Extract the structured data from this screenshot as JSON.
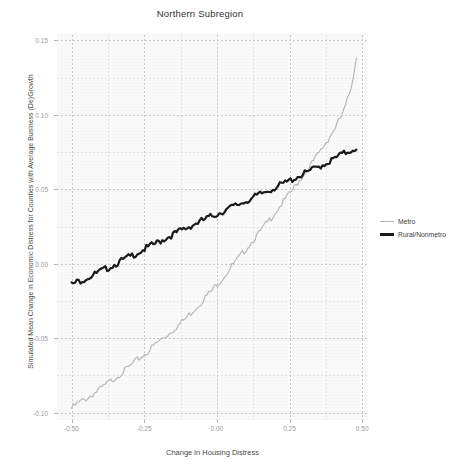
{
  "chart_data": {
    "type": "line",
    "title": "Northern Subregion",
    "xlabel": "Change in Housing Distress",
    "ylabel": "Simulated Mean Change in Economic Distress for Counties with Average Business (De)Growth",
    "xlim": [
      -0.55,
      0.52
    ],
    "ylim": [
      -0.105,
      0.155
    ],
    "xticks": [
      -0.5,
      -0.25,
      0.0,
      0.25,
      0.5
    ],
    "xtick_labels": [
      "-0.50",
      "-0.25",
      "0.00",
      "0.25",
      "0.50"
    ],
    "yticks": [
      0.15,
      0.1,
      0.05,
      0.0,
      -0.05,
      -0.1
    ],
    "ytick_labels": [
      "0.15",
      "0.10",
      "0.05",
      "0.00",
      "-0.05",
      "-0.10"
    ],
    "grid": true,
    "grid_style": "dashed",
    "legend_position": "right",
    "series": [
      {
        "name": "Metro",
        "color": "#b8b8b8",
        "width": 1.2,
        "x": [
          -0.5,
          -0.48,
          -0.46,
          -0.44,
          -0.42,
          -0.4,
          -0.38,
          -0.36,
          -0.34,
          -0.32,
          -0.3,
          -0.28,
          -0.26,
          -0.24,
          -0.22,
          -0.2,
          -0.18,
          -0.16,
          -0.14,
          -0.12,
          -0.1,
          -0.08,
          -0.06,
          -0.04,
          -0.02,
          0.0,
          0.02,
          0.04,
          0.06,
          0.08,
          0.1,
          0.12,
          0.14,
          0.16,
          0.18,
          0.2,
          0.22,
          0.24,
          0.26,
          0.28,
          0.3,
          0.32,
          0.34,
          0.36,
          0.38,
          0.4,
          0.42,
          0.44,
          0.46,
          0.48
        ],
        "y": [
          -0.096,
          -0.093,
          -0.0905,
          -0.0885,
          -0.0855,
          -0.083,
          -0.08,
          -0.077,
          -0.074,
          -0.071,
          -0.068,
          -0.0645,
          -0.0615,
          -0.0585,
          -0.0545,
          -0.051,
          -0.048,
          -0.045,
          -0.0415,
          -0.038,
          -0.034,
          -0.03,
          -0.026,
          -0.0215,
          -0.0175,
          -0.013,
          -0.0085,
          -0.0035,
          0.0015,
          0.006,
          0.011,
          0.016,
          0.0205,
          0.0255,
          0.0305,
          0.0355,
          0.0405,
          0.0455,
          0.0505,
          0.056,
          0.0615,
          0.0665,
          0.072,
          0.078,
          0.084,
          0.09,
          0.097,
          0.105,
          0.118,
          0.1395
        ]
      },
      {
        "name": "Rural/Nonmetro",
        "color": "#1b1b1b",
        "width": 2.2,
        "x": [
          -0.5,
          -0.48,
          -0.46,
          -0.44,
          -0.42,
          -0.4,
          -0.38,
          -0.36,
          -0.34,
          -0.32,
          -0.3,
          -0.28,
          -0.26,
          -0.24,
          -0.22,
          -0.2,
          -0.18,
          -0.16,
          -0.14,
          -0.12,
          -0.1,
          -0.08,
          -0.06,
          -0.04,
          -0.02,
          0.0,
          0.02,
          0.04,
          0.06,
          0.08,
          0.1,
          0.12,
          0.14,
          0.16,
          0.18,
          0.2,
          0.22,
          0.24,
          0.26,
          0.28,
          0.3,
          0.32,
          0.34,
          0.36,
          0.38,
          0.4,
          0.42,
          0.44,
          0.46,
          0.48
        ],
        "y": [
          -0.013,
          -0.011,
          -0.0095,
          -0.0078,
          -0.006,
          -0.004,
          -0.0022,
          -0.0002,
          0.0018,
          0.0038,
          0.0058,
          0.0078,
          0.0098,
          0.0118,
          0.0138,
          0.0158,
          0.0178,
          0.0198,
          0.0218,
          0.0238,
          0.0255,
          0.0275,
          0.0292,
          0.031,
          0.0328,
          0.0345,
          0.0362,
          0.038,
          0.0398,
          0.0415,
          0.0432,
          0.045,
          0.0468,
          0.0488,
          0.0505,
          0.0522,
          0.054,
          0.0558,
          0.0578,
          0.0598,
          0.0615,
          0.0635,
          0.0652,
          0.0672,
          0.069,
          0.071,
          0.0735,
          0.0755,
          0.0772,
          0.079
        ]
      }
    ]
  },
  "legend": {
    "items": [
      {
        "label": "Metro"
      },
      {
        "label": "Rural/Nonmetro"
      }
    ]
  }
}
